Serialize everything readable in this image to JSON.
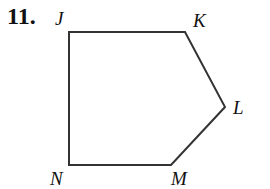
{
  "problem": {
    "number": "11."
  },
  "figure": {
    "shape": "pentagon",
    "vertices": [
      {
        "label": "J",
        "x": 69,
        "y": 32
      },
      {
        "label": "K",
        "x": 185,
        "y": 32
      },
      {
        "label": "L",
        "x": 225,
        "y": 107
      },
      {
        "label": "M",
        "x": 171,
        "y": 165
      },
      {
        "label": "N",
        "x": 69,
        "y": 165
      }
    ],
    "stroke_color": "#333333"
  }
}
